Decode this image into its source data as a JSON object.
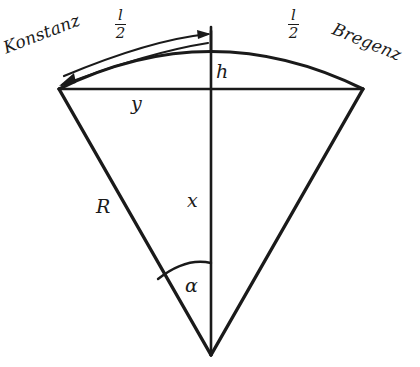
{
  "figure": {
    "background_color": "#ffffff",
    "stroke_color": "#1a1a1a",
    "labels": {
      "left_endpoint": "Konstanz",
      "right_endpoint": "Bregenz",
      "arc_half_left_numerator": "l",
      "arc_half_left_denominator": "2",
      "arc_half_right_numerator": "l",
      "arc_half_right_denominator": "2",
      "sagitta": "h",
      "half_chord": "y",
      "apothem": "x",
      "radius": "R",
      "half_angle": "α"
    }
  },
  "geometry": {
    "apex": {
      "x": 211,
      "y": 355
    },
    "chord_left": {
      "x": 59,
      "y": 89
    },
    "chord_right": {
      "x": 363,
      "y": 89
    },
    "arc_top": {
      "x": 211,
      "y": 52
    },
    "axis_top_tick": {
      "x": 211,
      "y": 31
    },
    "angle_arc_radius": 92,
    "radius_label_point": {
      "x": 103,
      "y": 207
    }
  }
}
